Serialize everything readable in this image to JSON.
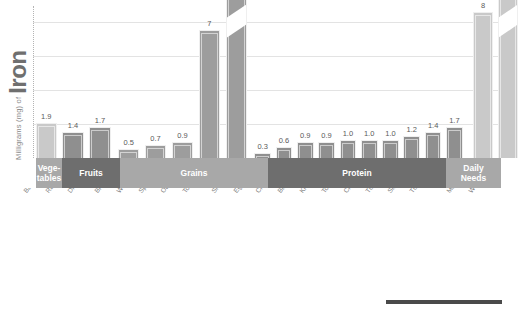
{
  "axis": {
    "title_small": "Milligrams (mg) of",
    "title_big": "Iron",
    "gridlines": true
  },
  "categories_band": [
    {
      "label": "Vege-\ntables",
      "shade": "g-light"
    },
    {
      "label": "Fruits",
      "shade": "g-dark"
    },
    {
      "label": "Grains",
      "shade": "g-light"
    },
    {
      "label": "Protein",
      "shade": "g-dark"
    },
    {
      "label": "Daily\nNeeds",
      "shade": "g-light"
    }
  ],
  "chart_data": {
    "type": "bar",
    "title": "Milligrams (mg) of Iron",
    "xlabel": "",
    "ylabel": "Milligrams (mg) of Iron",
    "ylim": [
      0,
      8
    ],
    "grid": true,
    "legend": "none",
    "note": "Bars labeled 18 use a broken axis (diagonal slash) because the value exceeds the plotted scale.",
    "categories": [
      "Baked potato with skin, 1 small",
      "Raisins, 1/2 cup",
      "Dried apricots, 1/2 cup",
      "Brown rice, cooked, 1/2 cup",
      "Whole-wheat or white bread, 1 slice",
      "Spaghetti (enriched), cooked, 1/2 cup",
      "Oatmeal, cooked, 1/2 cup",
      "Total cereal, 3/4 cup",
      "Shrimp, 3 oz",
      "Egg, hard cooked, 1",
      "Chicken breast, skinless, 3 oz",
      "Black beans, cooked, 1/4 cup",
      "Kidney beans, cooked, 1/4 cup",
      "Tofu, firm, 2 oz, 1/4 cup",
      "Chickpeas, cooked, 1/4 cup",
      "Tuna, light, canned, 3 oz",
      "Sirloin steak, cooked, 3 oz",
      "Turkey, dark meat, cooked, 3 oz",
      "Turkey, dark meat, cooked, skinless, 3 oz",
      "Men 19 to 50 years",
      "Women 19 to 50 years"
    ],
    "values": [
      1.9,
      1.4,
      1.7,
      0.5,
      0.7,
      0.9,
      7,
      18,
      0.3,
      0.6,
      0.9,
      0.9,
      1.0,
      1.0,
      1.0,
      1.2,
      1.4,
      1.7,
      1.7,
      8,
      18
    ],
    "value_labels": [
      "1.9",
      "1.4",
      "1.7",
      "0.5",
      "0.7",
      "0.9",
      "7",
      "18",
      "0.3",
      "0.6",
      "0.9",
      "0.9",
      "1.0",
      "1.0",
      "1.0",
      "1.2",
      "1.4",
      "1.7",
      "1.7",
      "8",
      "18"
    ],
    "groups": [
      "Vegetables",
      "Fruits",
      "Fruits",
      "Grains",
      "Grains",
      "Grains",
      "Grains",
      "Grains",
      "Protein",
      "Protein",
      "Protein",
      "Protein",
      "Protein",
      "Protein",
      "Protein",
      "Protein",
      "Protein",
      "Protein",
      "Protein",
      "Daily Needs",
      "Daily Needs"
    ]
  }
}
